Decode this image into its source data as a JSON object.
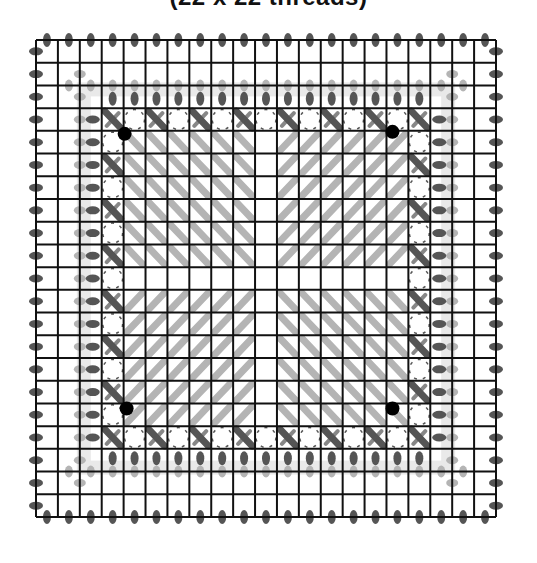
{
  "title": "(22 x 22 threads)",
  "diagram": {
    "threads": 22,
    "grid_origin": [
      36,
      40
    ],
    "grid_size": [
      460,
      477
    ],
    "colors": {
      "grid_line": "#111111",
      "dark_stitch": "#555555",
      "light_stitch": "#b4b4b4",
      "band_fill": "#e9e9e9",
      "dot": "#000000"
    },
    "corner_dots": [
      {
        "position": "top-left"
      },
      {
        "position": "top-right"
      },
      {
        "position": "bottom-left"
      },
      {
        "position": "bottom-right"
      }
    ],
    "center_pattern": {
      "top_left": "\\",
      "top_right": "/",
      "bottom_left": "/",
      "bottom_right": "\\"
    }
  }
}
